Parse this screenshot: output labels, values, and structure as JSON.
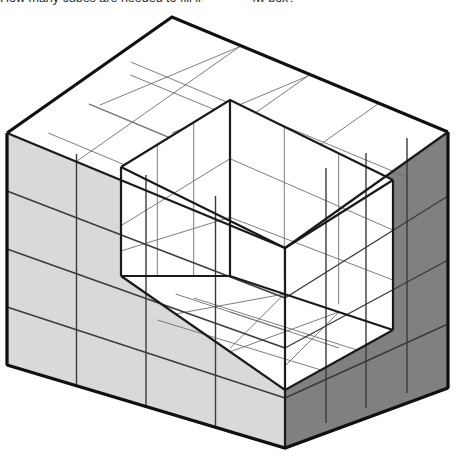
{
  "caption": {
    "text": "How many cubes are needed to fill in the hollow box?"
  },
  "figure": {
    "name": "isometric-hollow-cube-box",
    "projection": "isometric",
    "colors": {
      "top_face": "#ffffff",
      "left_face": "#d9d9d9",
      "right_face": "#808080",
      "interior_face": "#ffffff",
      "outline_stroke": "#111111",
      "grid_stroke": "#6e6e6e",
      "background": "#ffffff"
    },
    "dimensions": {
      "width_cubes": 4,
      "depth_cubes": 4,
      "height_cubes": 4,
      "wall_thickness_cubes": 1,
      "interior_width_cubes": 3,
      "interior_depth_cubes": 3,
      "interior_height_cubes": 3
    },
    "geometry": {
      "unit_x": 55.2,
      "unit_y": 29.0,
      "apex_x": 172,
      "apex_y": 17,
      "left_corner_x": 7,
      "left_corner_y": 133,
      "right_corner_x": 448,
      "right_corner_y": 132,
      "front_bottom_x": 285,
      "front_bottom_y": 448
    }
  }
}
